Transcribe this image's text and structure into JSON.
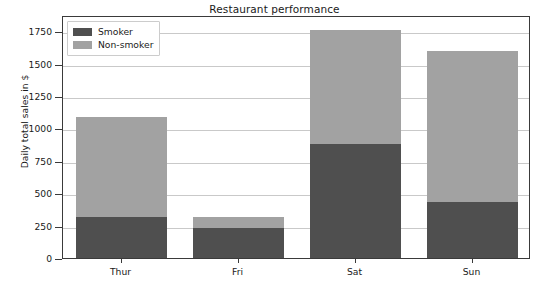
{
  "chart_data": {
    "type": "bar",
    "subtype": "stacked-bar",
    "title": "Restaurant performance",
    "xlabel": "",
    "ylabel": "Daily total sales in $",
    "categories": [
      "Thur",
      "Fri",
      "Sat",
      "Sun"
    ],
    "series": [
      {
        "name": "Smoker",
        "color": "#4f4f4f",
        "values": [
          320,
          235,
          880,
          430
        ]
      },
      {
        "name": "Non-smoker",
        "color": "#a2a2a2",
        "values": [
          770,
          80,
          880,
          1170
        ]
      }
    ],
    "totals": [
      1090,
      315,
      1760,
      1600
    ],
    "ylim": [
      0,
      1875
    ],
    "yticks": [
      0,
      250,
      500,
      750,
      1000,
      1250,
      1500,
      1750
    ],
    "ytick_labels": [
      "0",
      "250",
      "500",
      "750",
      "1000",
      "1250",
      "1500",
      "1750"
    ],
    "grid": true,
    "grid_axis": "y",
    "legend": {
      "position": "upper left",
      "entries": [
        {
          "label": "Smoker",
          "color": "#4f4f4f"
        },
        {
          "label": "Non-smoker",
          "color": "#a2a2a2"
        }
      ]
    }
  }
}
